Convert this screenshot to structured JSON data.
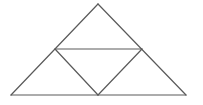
{
  "diagram": {
    "type": "subdivided-triangle",
    "background": "#ffffff",
    "stroke_color": "#5a5a5a",
    "stroke_width": 1.2,
    "vertices": {
      "apex": [
        98,
        4
      ],
      "bottom_left": [
        11,
        95
      ],
      "bottom_right": [
        186,
        95
      ],
      "mid_left": [
        55,
        49
      ],
      "mid_right": [
        142,
        49
      ],
      "mid_bottom": [
        98,
        95
      ]
    },
    "segments": [
      {
        "name": "outer-left-edge",
        "from": "apex",
        "to": "bottom_left"
      },
      {
        "name": "outer-right-edge",
        "from": "apex",
        "to": "bottom_right"
      },
      {
        "name": "outer-base-edge",
        "from": "bottom_left",
        "to": "bottom_right"
      },
      {
        "name": "midline-horizontal",
        "from": "mid_left",
        "to": "mid_right"
      },
      {
        "name": "midline-left-diagonal",
        "from": "mid_left",
        "to": "mid_bottom"
      },
      {
        "name": "midline-right-diagonal",
        "from": "mid_right",
        "to": "mid_bottom"
      }
    ]
  }
}
